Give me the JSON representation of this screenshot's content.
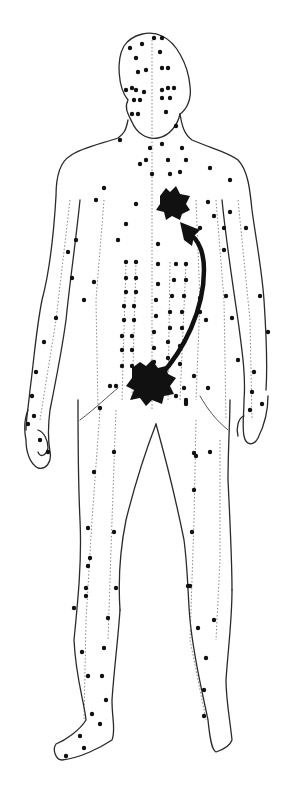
{
  "figure": {
    "view": "anterior",
    "colors": {
      "ink": "#111111",
      "outline": "#2a2a2a",
      "background": "#ffffff"
    },
    "regions": [
      "head",
      "neck",
      "chest",
      "abdomen",
      "left-arm",
      "right-arm",
      "pelvis",
      "left-leg",
      "right-leg",
      "left-foot",
      "right-foot"
    ],
    "highlights": [
      {
        "id": "lower-center",
        "region": "lower abdomen / pelvis",
        "shape": "black star-burst blob"
      },
      {
        "id": "upper-center",
        "region": "upper chest",
        "shape": "black star-burst blob"
      }
    ],
    "flow_arrow": {
      "from": "lower-center",
      "to": "upper-center",
      "direction": "upward"
    },
    "meridian_lines": "dotted vertical channels with acupuncture points along the body and limbs"
  }
}
